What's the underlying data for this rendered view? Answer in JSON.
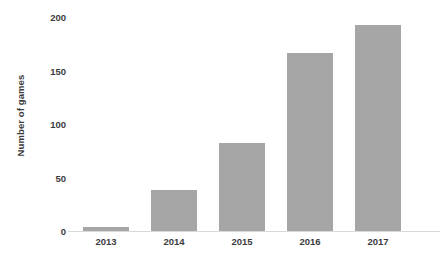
{
  "chart_data": {
    "type": "bar",
    "title": "",
    "subtitle": "",
    "xlabel": "",
    "ylabel": "Number of games",
    "categories": [
      "2013",
      "2014",
      "2015",
      "2016",
      "2017"
    ],
    "values": [
      4,
      38,
      82,
      166,
      193
    ],
    "series": [
      {
        "name": "Number of games",
        "values": [
          4,
          38,
          82,
          166,
          193
        ]
      }
    ],
    "ylim": [
      0,
      200
    ],
    "yticks": [
      0,
      50,
      100,
      150,
      200
    ],
    "ytick_labels": [
      "0",
      "50",
      "100",
      "150",
      "200"
    ],
    "grid": false,
    "legend": false,
    "legend_position": "none",
    "bar_color": "#a6a6a6",
    "axis_color": "#d9d9d9",
    "text_color": "#3b3b3b",
    "background": "#ffffff",
    "annotations": []
  },
  "axes": {
    "y_title": "Number of games",
    "y_ticks": [
      {
        "label": "200",
        "value": 200
      },
      {
        "label": "150",
        "value": 150
      },
      {
        "label": "100",
        "value": 100
      },
      {
        "label": "50",
        "value": 50
      },
      {
        "label": "0",
        "value": 0
      }
    ],
    "x_ticks": [
      {
        "label": "2013"
      },
      {
        "label": "2014"
      },
      {
        "label": "2015"
      },
      {
        "label": "2016"
      },
      {
        "label": "2017"
      }
    ]
  }
}
